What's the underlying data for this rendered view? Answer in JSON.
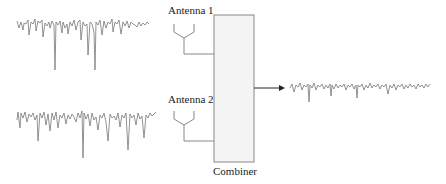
{
  "diagram": {
    "antennas": [
      {
        "label": "Antenna 1",
        "signal": "faded-signal-1"
      },
      {
        "label": "Antenna 2",
        "signal": "faded-signal-2"
      }
    ],
    "combiner": {
      "label": "Combiner",
      "fill": "#f4f4f4",
      "stroke": "#888888"
    },
    "output": {
      "signal": "combined-signal"
    },
    "colors": {
      "waveform": "#777777",
      "lines": "#888888",
      "arrow": "#222222"
    }
  }
}
